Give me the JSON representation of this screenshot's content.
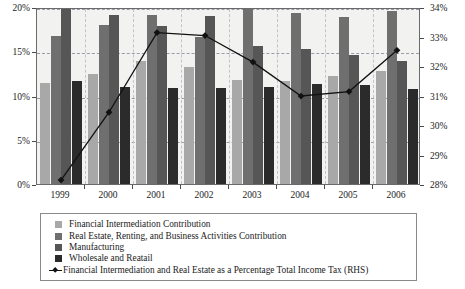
{
  "chart_data": {
    "type": "bar",
    "title": "",
    "subtitle": "",
    "xlabel": "",
    "ylabel": "",
    "categories": [
      "1999",
      "2000",
      "2001",
      "2002",
      "2003",
      "2004",
      "2005",
      "2006"
    ],
    "grid": true,
    "legend_position": "bottom",
    "axes": {
      "left": {
        "label": "",
        "ylim": [
          0,
          20
        ],
        "ticks": [
          0,
          5,
          10,
          15,
          20
        ],
        "tick_labels": [
          "0%",
          "5%",
          "10%",
          "15%",
          "20%"
        ],
        "applies_to": "bars"
      },
      "right": {
        "label": "RHS",
        "ylim": [
          28,
          34
        ],
        "ticks": [
          28,
          29,
          30,
          31,
          32,
          33,
          34
        ],
        "tick_labels": [
          "28%",
          "29%",
          "30%",
          "31%",
          "32%",
          "33%",
          "34%"
        ],
        "applies_to": "line"
      }
    },
    "series": [
      {
        "name": "Financial Intermediation Contribution",
        "kind": "bar",
        "axis": "left",
        "color": "#a8a8a8",
        "values": [
          11.4,
          12.4,
          13.9,
          13.2,
          11.8,
          11.6,
          12.2,
          12.8
        ]
      },
      {
        "name": "Real Estate, Renting, and Business Activities Contribution",
        "kind": "bar",
        "axis": "left",
        "color": "#6f6f6f",
        "values": [
          16.7,
          18.0,
          19.1,
          16.6,
          20.2,
          19.3,
          18.9,
          19.6
        ]
      },
      {
        "name": "Manufacturing",
        "kind": "bar",
        "axis": "left",
        "color": "#565656",
        "values": [
          20.0,
          19.1,
          17.8,
          19.0,
          15.6,
          15.2,
          14.6,
          13.9
        ]
      },
      {
        "name": "Wholesale and Reatail",
        "kind": "bar",
        "axis": "left",
        "color": "#2b2b2b",
        "values": [
          11.6,
          11.0,
          10.8,
          10.8,
          11.0,
          11.3,
          11.2,
          10.7
        ]
      },
      {
        "name": "Financial Intermediation and Real Estate as a Percentage Total Income Tax (RHS)",
        "kind": "line",
        "axis": "right",
        "color": "#111111",
        "marker": "diamond",
        "values": [
          28.2,
          30.5,
          33.2,
          33.1,
          32.2,
          31.05,
          31.2,
          32.6
        ]
      }
    ]
  },
  "legend": {
    "items": [
      {
        "label": "Financial Intermediation Contribution",
        "swatch": "#a8a8a8",
        "marker": "square"
      },
      {
        "label": "Real Estate, Renting, and Business Activities Contribution",
        "swatch": "#6f6f6f",
        "marker": "square"
      },
      {
        "label": "Manufacturing",
        "swatch": "#565656",
        "marker": "square"
      },
      {
        "label": "Wholesale and Reatail",
        "swatch": "#2b2b2b",
        "marker": "square"
      },
      {
        "label": "Financial Intermediation and Real Estate as a Percentage Total Income Tax (RHS)",
        "swatch": "#111111",
        "marker": "line-diamond"
      }
    ]
  }
}
